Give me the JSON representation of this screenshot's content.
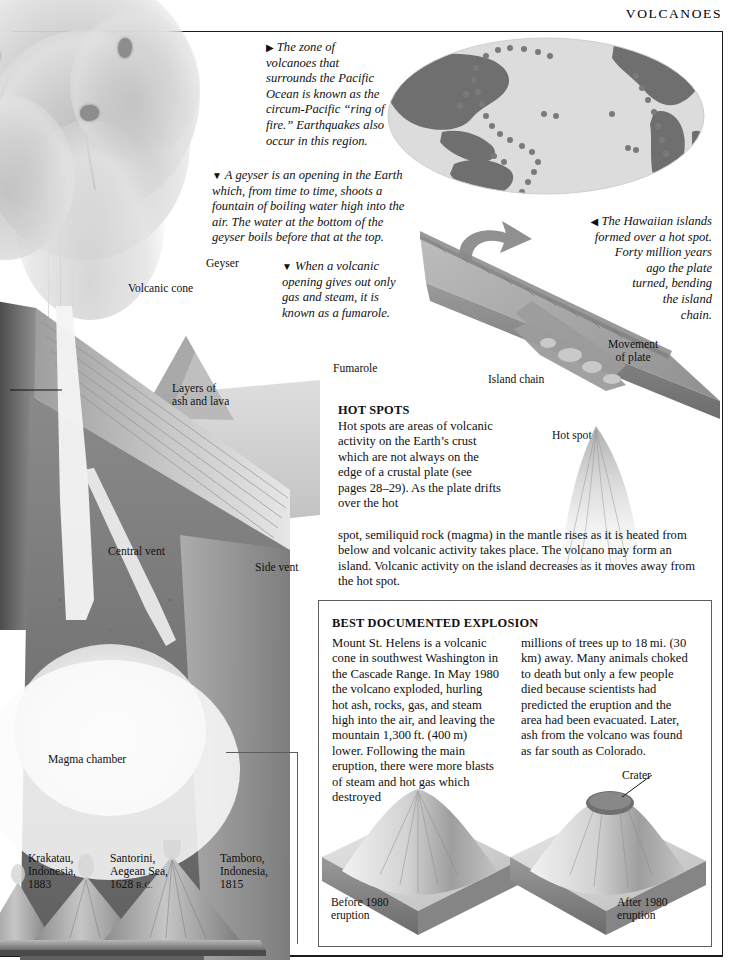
{
  "header": {
    "title": "VOLCANOES"
  },
  "callouts": {
    "ring_of_fire": {
      "marker": "▶",
      "text": "The zone of volcanoes that surrounds the Pacific Ocean is known as the circum-Pacific “ring of fire.” Earthquakes also occur in this region."
    },
    "geyser": {
      "marker": "▼",
      "text": "A geyser is an opening in the Earth which, from time to time, shoots a fountain of boiling water high into the air. The water at the bottom of the geyser boils before that at the top."
    },
    "fumarole": {
      "marker": "▼",
      "text": "When a volcanic opening gives out only gas and steam, it is known as a fumarole."
    },
    "hawaii": {
      "marker": "◀",
      "lines": [
        "The Hawaiian islands",
        "formed over a hot spot.",
        "Forty million years",
        "ago the plate",
        "turned, bending",
        "the island",
        "chain."
      ]
    }
  },
  "diagram_labels": {
    "volcanic_cone": "Volcanic cone",
    "geyser": "Geyser",
    "fumarole": "Fumarole",
    "layers": "Layers of\nash and lava",
    "layers_line1": "Layers of",
    "layers_line2": "ash and lava",
    "central_vent": "Central vent",
    "side_vent": "Side vent",
    "magma_chamber": "Magma chamber",
    "island_chain": "Island chain",
    "hot_spot": "Hot spot",
    "movement_line1": "Movement",
    "movement_line2": "of plate",
    "crater": "Crater",
    "before_line1": "Before 1980",
    "before_line2": "eruption",
    "after_line1": "After 1980",
    "after_line2": "eruption"
  },
  "hot_spots": {
    "heading": "HOT SPOTS",
    "narrow_text": "Hot spots are areas of volcanic activity on the Earth’s crust which are not always on the edge of a crustal plate (see pages 28–29). As the plate drifts over the hot",
    "narrow_italic": "see pages 28–29",
    "wide_text": "spot, semiliquid rock (magma) in the mantle rises as it is heated from below and volcanic activity takes place. The volcano may form an island. Volcanic activity on the island decreases as it moves away from the hot spot."
  },
  "explosion_box": {
    "heading": "BEST DOCUMENTED EXPLOSION",
    "column_left": "Mount St. Helens is a volcanic cone in southwest Washington in the Cascade Range. In May 1980 the volcano exploded, hurling hot ash, rocks, gas, and steam high into the air, and leaving the mountain 1,300 ft. (400 m) lower. Following the main eruption, there were more blasts of steam and hot gas which destroyed",
    "column_right": "millions of trees up to 18 mi. (30 km) away. Many animals choked to death but only a few people died because scientists had predicted the eruption and the area had been evacuated. Later, ash from the volcano was found as far south as Colorado."
  },
  "famous_eruptions": [
    {
      "name": "Krakatau,",
      "place": "Indonesia,",
      "year": "1883",
      "era": ""
    },
    {
      "name": "Santorini,",
      "place": "Aegean Sea,",
      "year": "1628",
      "era": "B.C."
    },
    {
      "name": "Tamboro,",
      "place": "Indonesia,",
      "year": "1815",
      "era": ""
    }
  ],
  "colors": {
    "ink": "#101010",
    "rule": "#1a1a1a",
    "frame": "#5d5d5d",
    "land": "#6f6f6f",
    "ocean": "#dcdcdc",
    "dot": "#7a7a7a",
    "slab_top": "#a8a8a8",
    "slab_side": "#8a8a8a",
    "rock_dark": "#6a6a6a",
    "rock_mid": "#9a9a9a",
    "ash_light": "#d9d9d9"
  }
}
